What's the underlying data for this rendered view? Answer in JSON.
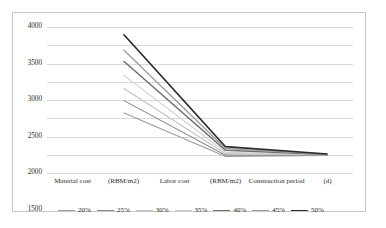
{
  "chart_data": {
    "type": "line",
    "title": "",
    "xlabel": "",
    "ylabel": "",
    "ylim": [
      0,
      4000
    ],
    "ytick_values": [
      4000,
      3500,
      3000,
      2500,
      2000,
      1500,
      1000,
      500,
      0
    ],
    "ytick_labels": [
      "4000",
      "3500",
      "3000",
      "2500",
      "2000",
      "1500",
      "1000",
      "500",
      "0"
    ],
    "grid": true,
    "legend_position": "bottom",
    "categories": [
      "Material cost",
      "(RBM/m2)",
      "Labor cost",
      "(RBM/m2)",
      "Construction period",
      "(d)"
    ],
    "x_index_of_points": [
      1,
      3,
      5
    ],
    "series": [
      {
        "name": "20%",
        "color": "#9a9a9a",
        "width": 1.1,
        "values": [
          null,
          1650,
          null,
          450,
          null,
          480
        ]
      },
      {
        "name": "25%",
        "color": "#8a8a8a",
        "width": 1.1,
        "values": [
          null,
          1990,
          null,
          490,
          null,
          490
        ]
      },
      {
        "name": "30%",
        "color": "#c2c2c2",
        "width": 1.1,
        "values": [
          null,
          2320,
          null,
          530,
          null,
          495
        ]
      },
      {
        "name": "35%",
        "color": "#cfcfcf",
        "width": 1.1,
        "values": [
          null,
          2680,
          null,
          570,
          null,
          500
        ]
      },
      {
        "name": "40%",
        "color": "#6f6f6f",
        "width": 1.5,
        "values": [
          null,
          3070,
          null,
          620,
          null,
          505
        ]
      },
      {
        "name": "45%",
        "color": "#9f9f9f",
        "width": 1.4,
        "values": [
          null,
          3380,
          null,
          670,
          null,
          510
        ]
      },
      {
        "name": "50%",
        "color": "#2b2b2b",
        "width": 1.7,
        "values": [
          null,
          3800,
          null,
          720,
          null,
          520
        ]
      }
    ]
  },
  "frame": {
    "border_color": "#c9c9c9",
    "background": "#ffffff"
  }
}
